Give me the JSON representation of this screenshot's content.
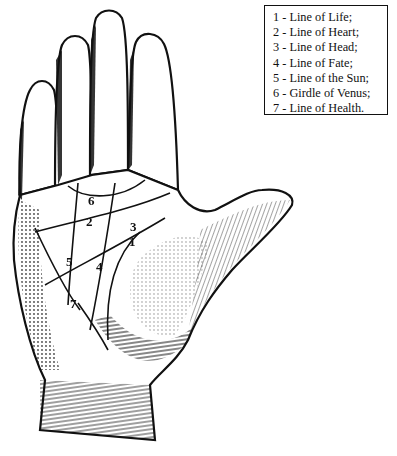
{
  "figure": {
    "ink_color": "#111111",
    "background": "#ffffff"
  },
  "legend": {
    "items": [
      {
        "number": "1",
        "text": "1 - Line of Life;"
      },
      {
        "number": "2",
        "text": "2 - Line of Heart;"
      },
      {
        "number": "3",
        "text": "3 - Line of Head;"
      },
      {
        "number": "4",
        "text": "4 - Line of Fate;"
      },
      {
        "number": "5",
        "text": "5 - Line of the Sun;"
      },
      {
        "number": "6",
        "text": "6 - Girdle of Venus;"
      },
      {
        "number": "7",
        "text": "7 - Line of Health."
      }
    ]
  },
  "labels": [
    {
      "text": "1",
      "x": 129,
      "y": 235
    },
    {
      "text": "2",
      "x": 86,
      "y": 215
    },
    {
      "text": "3",
      "x": 130,
      "y": 220
    },
    {
      "text": "4",
      "x": 96,
      "y": 260
    },
    {
      "text": "5",
      "x": 66,
      "y": 255
    },
    {
      "text": "6",
      "x": 88,
      "y": 194
    },
    {
      "text": "7",
      "x": 70,
      "y": 297
    }
  ]
}
